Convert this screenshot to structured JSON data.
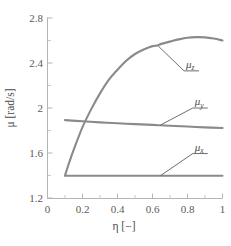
{
  "chart_data": {
    "type": "line",
    "title": "",
    "xlabel": "η [−]",
    "ylabel": "μ [rad/s]",
    "xlim": [
      0,
      1
    ],
    "ylim": [
      1.2,
      2.8
    ],
    "xticks": [
      "0",
      "0.2",
      "0.4",
      "0.6",
      "0.8",
      "1"
    ],
    "xtick_values": [
      0,
      0.2,
      0.4,
      0.6,
      0.8,
      1
    ],
    "yticks": [
      "2.8",
      "2.4",
      "2",
      "1.6",
      "1.2"
    ],
    "ytick_values": [
      2.8,
      2.4,
      2.0,
      1.6,
      1.2
    ],
    "grid": false,
    "legend_position": "inline-annotations",
    "line_color": "#8a8a8a",
    "axis_color": "#b5b5b5",
    "series": [
      {
        "name": "μ_z",
        "label_base": "μ",
        "label_sub": "z",
        "x": [
          0.1,
          0.125,
          0.15,
          0.2,
          0.25,
          0.3,
          0.35,
          0.4,
          0.45,
          0.5,
          0.55,
          0.6,
          0.625,
          0.65,
          0.7,
          0.75,
          0.8,
          0.85,
          0.9,
          0.95,
          1.0
        ],
        "values": [
          1.4,
          1.52,
          1.63,
          1.83,
          1.99,
          2.13,
          2.25,
          2.34,
          2.42,
          2.48,
          2.52,
          2.55,
          2.555,
          2.57,
          2.59,
          2.61,
          2.625,
          2.63,
          2.628,
          2.617,
          2.6
        ]
      },
      {
        "name": "μ_y",
        "label_base": "μ",
        "label_sub": "y",
        "x": [
          0.1,
          0.2,
          0.3,
          0.4,
          0.5,
          0.6,
          0.65,
          0.7,
          0.8,
          0.9,
          1.0
        ],
        "values": [
          1.892,
          1.882,
          1.872,
          1.864,
          1.857,
          1.85,
          1.846,
          1.842,
          1.835,
          1.828,
          1.822
        ]
      },
      {
        "name": "μ_x",
        "label_base": "μ",
        "label_sub": "x",
        "x": [
          0.1,
          0.2,
          0.3,
          0.4,
          0.5,
          0.6,
          0.65,
          0.7,
          0.8,
          0.9,
          1.0
        ],
        "values": [
          1.398,
          1.398,
          1.398,
          1.398,
          1.398,
          1.398,
          1.398,
          1.398,
          1.398,
          1.398,
          1.398
        ]
      }
    ],
    "annotations": [
      {
        "text": "μ_z",
        "base": "μ",
        "sub": "z",
        "anchor_x": 0.63,
        "anchor_y": 2.555,
        "label_x": 0.78,
        "label_y": 2.33
      },
      {
        "text": "μ_y",
        "base": "μ",
        "sub": "y",
        "anchor_x": 0.645,
        "anchor_y": 1.848,
        "label_x": 0.83,
        "label_y": 2.0
      },
      {
        "text": "μ_x",
        "base": "μ",
        "sub": "x",
        "anchor_x": 0.645,
        "anchor_y": 1.398,
        "label_x": 0.83,
        "label_y": 1.595
      }
    ]
  }
}
